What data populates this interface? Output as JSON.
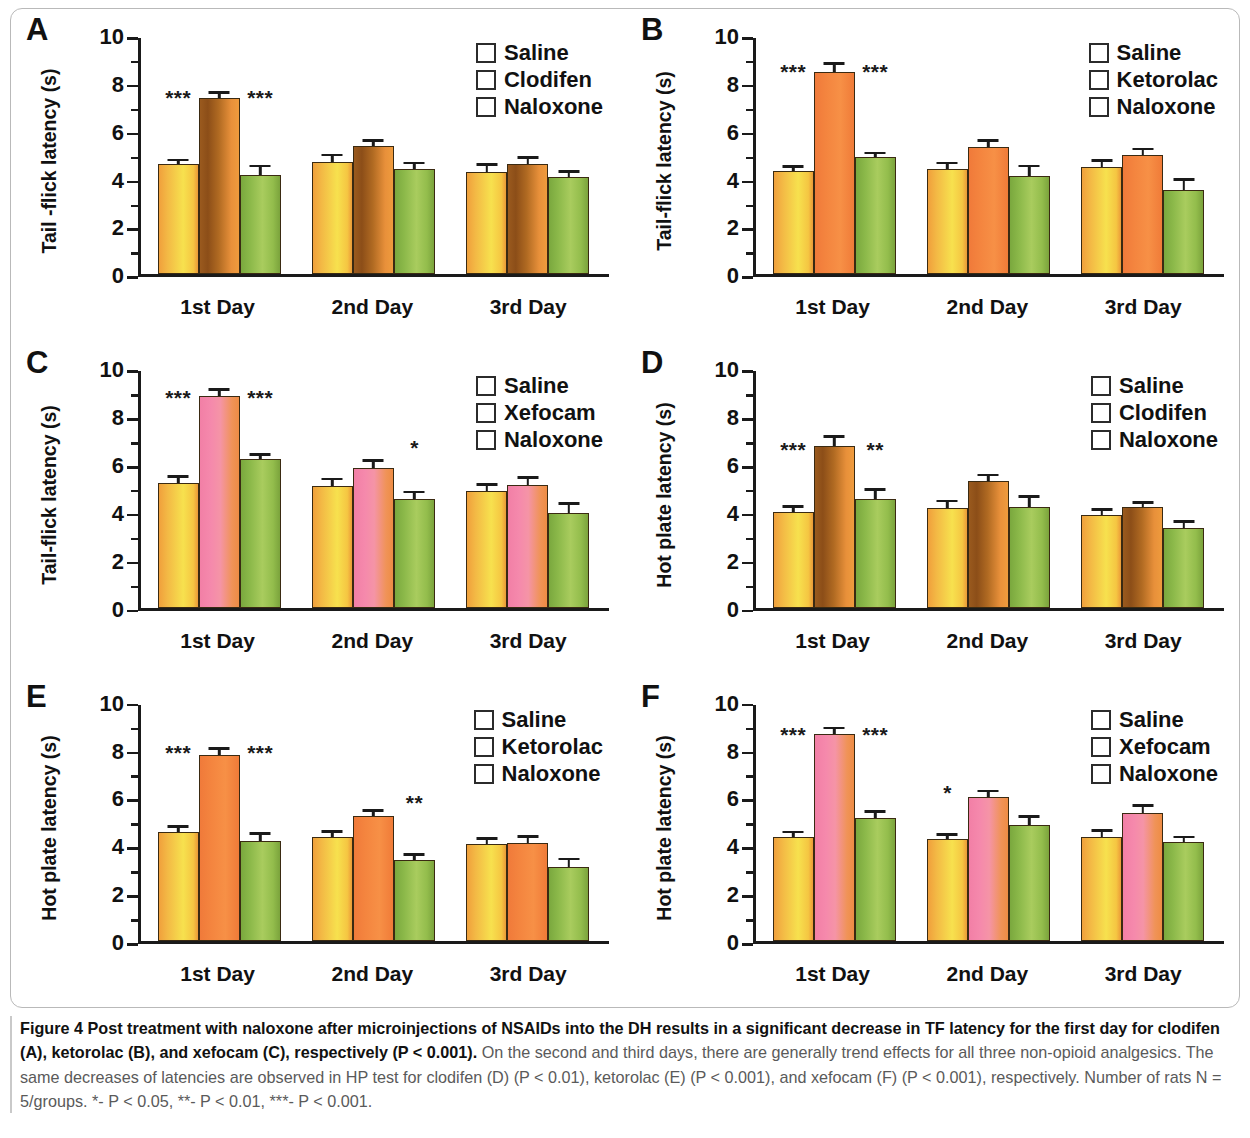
{
  "figure": {
    "label": "Figure 4",
    "caption_bold": "Post treatment with naloxone after microinjections of NSAIDs into the DH results in a significant decrease in TF latency for the first day for clodifen (A), ketorolac (B), and xefocam (C), respectively (P < 0.001).",
    "caption_rest": " On the second and third days, there are generally trend effects for all three non-opioid analgesics. The same decreases of latencies are observed in HP test for clodifen (D) (P < 0.01), ketorolac (E) (P < 0.001), and xefocam (F) (P < 0.001), respectively. Number of rats N = 5/groups. *- P < 0.05, **- P < 0.01, ***- P < 0.001."
  },
  "colors": {
    "saline": "#f7c544",
    "clodifen": "#9e5d20",
    "ketorolac": "#f4853f",
    "xefocam": "#f489ab",
    "naloxone": "#93bd4c",
    "axis": "#1a1a1a"
  },
  "axis": {
    "y_ticks": [
      "0",
      "2",
      "4",
      "6",
      "8",
      "10"
    ],
    "y_minor": [
      1,
      3,
      5,
      7,
      9
    ],
    "ylim": [
      0,
      10
    ],
    "x_categories": [
      "1st Day",
      "2nd Day",
      "3rd Day"
    ]
  },
  "chart_data": [
    {
      "type": "bar",
      "panel": "A",
      "title": "",
      "xlabel": "",
      "ylabel": "Tail -flick latency (s)",
      "ylim": [
        0,
        10
      ],
      "grid": false,
      "legend_position": "top-right",
      "categories": [
        "1st Day",
        "2nd Day",
        "3rd Day"
      ],
      "series": [
        {
          "name": "Saline",
          "color_key": "saline",
          "values": [
            4.67,
            4.75,
            4.35
          ],
          "errors": [
            0.15,
            0.28,
            0.28
          ]
        },
        {
          "name": "Clodifen",
          "color_key": "clodifen",
          "values": [
            7.47,
            5.43,
            4.67
          ],
          "errors": [
            0.2,
            0.23,
            0.25
          ]
        },
        {
          "name": "Naloxone",
          "color_key": "naloxone",
          "values": [
            4.2,
            4.45,
            4.1
          ],
          "errors": [
            0.38,
            0.25,
            0.25
          ]
        }
      ],
      "annotations": [
        {
          "group": 0,
          "slot": 0,
          "text": "***",
          "y": 7.05
        },
        {
          "group": 0,
          "slot": 2,
          "text": "***",
          "y": 7.05
        }
      ]
    },
    {
      "type": "bar",
      "panel": "B",
      "title": "",
      "xlabel": "",
      "ylabel": "Tail-flick latency (s)",
      "ylim": [
        0,
        10
      ],
      "grid": false,
      "legend_position": "top-right",
      "categories": [
        "1st Day",
        "2nd Day",
        "3rd Day"
      ],
      "series": [
        {
          "name": "Saline",
          "color_key": "saline",
          "values": [
            4.37,
            4.45,
            4.55
          ],
          "errors": [
            0.18,
            0.25,
            0.25
          ]
        },
        {
          "name": "Ketorolac",
          "color_key": "ketorolac",
          "values": [
            8.58,
            5.4,
            5.07
          ],
          "errors": [
            0.32,
            0.25,
            0.22
          ]
        },
        {
          "name": "Naloxone",
          "color_key": "naloxone",
          "values": [
            4.95,
            4.15,
            3.58
          ],
          "errors": [
            0.18,
            0.42,
            0.42
          ]
        }
      ],
      "annotations": [
        {
          "group": 0,
          "slot": 0,
          "text": "***",
          "y": 8.15
        },
        {
          "group": 0,
          "slot": 2,
          "text": "***",
          "y": 8.15
        }
      ]
    },
    {
      "type": "bar",
      "panel": "C",
      "title": "",
      "xlabel": "",
      "ylabel": "Tail-flick latency (s)",
      "ylim": [
        0,
        10
      ],
      "grid": false,
      "legend_position": "top-right",
      "categories": [
        "1st Day",
        "2nd Day",
        "3rd Day"
      ],
      "series": [
        {
          "name": "Saline",
          "color_key": "saline",
          "values": [
            5.28,
            5.13,
            4.92
          ],
          "errors": [
            0.25,
            0.3,
            0.28
          ]
        },
        {
          "name": "Xefocam",
          "color_key": "xefocam",
          "values": [
            8.95,
            5.9,
            5.2
          ],
          "errors": [
            0.28,
            0.32,
            0.3
          ]
        },
        {
          "name": "Naloxone",
          "color_key": "naloxone",
          "values": [
            6.28,
            4.58,
            4.02
          ],
          "errors": [
            0.2,
            0.3,
            0.38
          ]
        }
      ],
      "annotations": [
        {
          "group": 0,
          "slot": 0,
          "text": "***",
          "y": 8.45
        },
        {
          "group": 0,
          "slot": 2,
          "text": "***",
          "y": 8.45
        },
        {
          "group": 1,
          "slot": 2,
          "text": "*",
          "y": 6.35
        }
      ]
    },
    {
      "type": "bar",
      "panel": "D",
      "title": "",
      "xlabel": "",
      "ylabel": "Hot plate latency (s)",
      "ylim": [
        0,
        10
      ],
      "grid": false,
      "legend_position": "top-right",
      "categories": [
        "1st Day",
        "2nd Day",
        "3rd Day"
      ],
      "series": [
        {
          "name": "Saline",
          "color_key": "saline",
          "values": [
            4.05,
            4.22,
            3.92
          ],
          "errors": [
            0.22,
            0.28,
            0.22
          ]
        },
        {
          "name": "Clodifen",
          "color_key": "clodifen",
          "values": [
            6.82,
            5.35,
            4.25
          ],
          "errors": [
            0.42,
            0.25,
            0.2
          ]
        },
        {
          "name": "Naloxone",
          "color_key": "naloxone",
          "values": [
            4.58,
            4.28,
            3.38
          ],
          "errors": [
            0.42,
            0.42,
            0.25
          ]
        }
      ],
      "annotations": [
        {
          "group": 0,
          "slot": 0,
          "text": "***",
          "y": 6.25
        },
        {
          "group": 0,
          "slot": 2,
          "text": "**",
          "y": 6.25
        }
      ]
    },
    {
      "type": "bar",
      "panel": "E",
      "title": "",
      "xlabel": "",
      "ylabel": "Hot plate latency (s)",
      "ylim": [
        0,
        10
      ],
      "grid": false,
      "legend_position": "top-right",
      "categories": [
        "1st Day",
        "2nd Day",
        "3rd Day"
      ],
      "series": [
        {
          "name": "Saline",
          "color_key": "saline",
          "values": [
            4.63,
            4.42,
            4.1
          ],
          "errors": [
            0.2,
            0.2,
            0.22
          ]
        },
        {
          "name": "Ketorolac",
          "color_key": "ketorolac",
          "values": [
            7.88,
            5.28,
            4.15
          ],
          "errors": [
            0.25,
            0.22,
            0.25
          ]
        },
        {
          "name": "Naloxone",
          "color_key": "naloxone",
          "values": [
            4.25,
            3.42,
            3.15
          ],
          "errors": [
            0.28,
            0.22,
            0.3
          ]
        }
      ],
      "annotations": [
        {
          "group": 0,
          "slot": 0,
          "text": "***",
          "y": 7.55
        },
        {
          "group": 0,
          "slot": 2,
          "text": "***",
          "y": 7.55
        },
        {
          "group": 1,
          "slot": 2,
          "text": "**",
          "y": 5.4
        }
      ]
    },
    {
      "type": "bar",
      "panel": "F",
      "title": "",
      "xlabel": "",
      "ylabel": "Hot plate latency (s)",
      "ylim": [
        0,
        10
      ],
      "grid": false,
      "legend_position": "top-right",
      "categories": [
        "1st Day",
        "2nd Day",
        "3rd Day"
      ],
      "series": [
        {
          "name": "Saline",
          "color_key": "saline",
          "values": [
            4.4,
            4.32,
            4.42
          ],
          "errors": [
            0.2,
            0.18,
            0.25
          ]
        },
        {
          "name": "Xefocam",
          "color_key": "xefocam",
          "values": [
            8.78,
            6.08,
            5.43
          ],
          "errors": [
            0.22,
            0.25,
            0.28
          ]
        },
        {
          "name": "Naloxone",
          "color_key": "naloxone",
          "values": [
            5.22,
            4.9,
            4.18
          ],
          "errors": [
            0.25,
            0.35,
            0.2
          ]
        }
      ],
      "annotations": [
        {
          "group": 0,
          "slot": 0,
          "text": "***",
          "y": 8.3
        },
        {
          "group": 0,
          "slot": 2,
          "text": "***",
          "y": 8.3
        },
        {
          "group": 1,
          "slot": 0,
          "text": "*",
          "y": 5.85
        }
      ]
    }
  ]
}
